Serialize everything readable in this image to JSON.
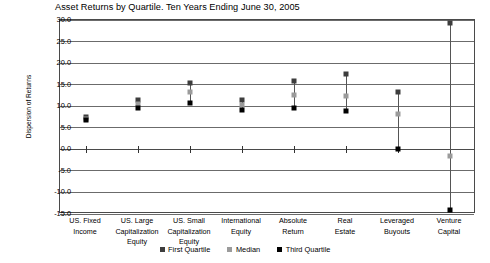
{
  "chart_data": {
    "type": "scatter",
    "title": "Asset Returns by Quartile.  Ten Years Ending June 30, 2005",
    "xlabel": "",
    "ylabel": "Dispersion of Returns",
    "ylim": [
      -15.0,
      30.0
    ],
    "ytick_labels": [
      "30.0",
      "25.0",
      "20.0",
      "15.0",
      "10.0",
      "5.0",
      "0.0",
      "-5.0",
      "-10.0",
      "-15.0"
    ],
    "ytick_values": [
      30.0,
      25.0,
      20.0,
      15.0,
      10.0,
      5.0,
      0.0,
      -5.0,
      -10.0,
      -15.0
    ],
    "grid": true,
    "legend_position": "bottom",
    "categories": [
      "US. Fixed Income",
      "US. Large Capitalization Equity",
      "US. Small Capitalization Equity",
      "International Equity",
      "Absolute Return",
      "Real Estate",
      "Leveraged Buyouts",
      "Venture Capital"
    ],
    "category_lines": [
      [
        "US. Fixed",
        "Income"
      ],
      [
        "US. Large",
        "Capitalization",
        "Equity"
      ],
      [
        "US. Small",
        "Capitalization",
        "Equity"
      ],
      [
        "International",
        "Equity"
      ],
      [
        "Absolute",
        "Return"
      ],
      [
        "Real",
        "Estate"
      ],
      [
        "Leveraged",
        "Buyouts"
      ],
      [
        "Venture",
        "Capital"
      ]
    ],
    "series": [
      {
        "name": "First Quartile",
        "color": "#3d3d3d",
        "values": [
          7.4,
          11.4,
          15.3,
          11.4,
          15.8,
          17.5,
          13.4,
          29.3
        ]
      },
      {
        "name": "Median",
        "color": "#9b9b9b",
        "values": [
          7.1,
          10.6,
          13.3,
          10.3,
          12.5,
          12.3,
          8.3,
          -1.5
        ]
      },
      {
        "name": "Third Quartile",
        "color": "#000000",
        "values": [
          6.8,
          9.7,
          10.7,
          9.2,
          9.6,
          9.0,
          0.0,
          -14.0
        ]
      }
    ]
  }
}
